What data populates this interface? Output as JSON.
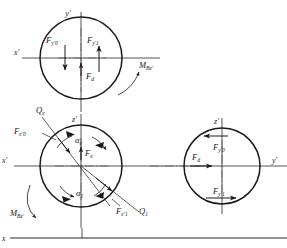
{
  "figure": {
    "background": "#ffffff",
    "line_color": "#1a1a1a",
    "centerline_color": "#555555",
    "baseline_color": "#6e6e6e",
    "width": 287,
    "height": 248
  },
  "axes": {
    "top_vertical": {
      "label": "y",
      "prime": "′"
    },
    "top_horizontal": {
      "label": "x",
      "prime": "′"
    },
    "mid_horizontal": {
      "label": "x",
      "prime": "′"
    },
    "mid_vertical": {
      "label": "z",
      "prime": "′"
    },
    "right_vertical": {
      "label": "z",
      "prime": "′"
    },
    "right_horizontal": {
      "label": "y",
      "prime": "′"
    },
    "baseline": {
      "label": "x",
      "prime": ""
    }
  },
  "circles": {
    "top": {
      "name": "top-circle",
      "cx": 81,
      "cy": 58,
      "r": 41,
      "labels": {
        "force_left": {
          "base": "F",
          "sub": "y′0"
        },
        "force_right": {
          "base": "F",
          "sub": "y′1"
        },
        "force_center": {
          "base": "F",
          "sub": "d"
        },
        "moment": {
          "base": "M",
          "sub": "Bz′"
        }
      }
    },
    "middle": {
      "name": "middle-circle",
      "cx": 81,
      "cy": 166,
      "r": 41,
      "labels": {
        "load_upper": {
          "base": "Q",
          "sub": "e"
        },
        "load_lower": {
          "base": "Q",
          "sub": "1"
        },
        "force_upper_left": {
          "base": "F",
          "sub": "e′0"
        },
        "force_lower_right": {
          "base": "F",
          "sub": "e′1"
        },
        "force_center": {
          "base": "F",
          "sub": "e"
        },
        "angle_upper": {
          "base": "α",
          "sub": "e"
        },
        "angle_lower": {
          "base": "α",
          "sub": "1"
        },
        "moment": {
          "base": "M",
          "sub": "Bz′"
        }
      }
    },
    "right": {
      "name": "right-circle",
      "cx": 222,
      "cy": 166,
      "r": 38,
      "labels": {
        "force_top": {
          "base": "F",
          "sub": "y′0"
        },
        "force_bottom": {
          "base": "F",
          "sub": "y′1"
        },
        "force_center": {
          "base": "F",
          "sub": "d"
        }
      }
    }
  }
}
